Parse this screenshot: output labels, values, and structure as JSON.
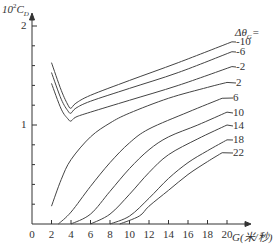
{
  "chart_data": {
    "type": "line",
    "title": "",
    "ylabel": "10²C_D",
    "xlabel": "G(米/秒)",
    "xlim": [
      0,
      20.5
    ],
    "ylim": [
      0,
      2
    ],
    "x_ticks": [
      "0",
      "2",
      "4",
      "6",
      "8",
      "10",
      "12",
      "14",
      "16",
      "18",
      "20"
    ],
    "y_ticks": [
      "1",
      "2"
    ],
    "grid": false,
    "legend_title": "Δθ_G=",
    "legend_position": "inline-right",
    "series": [
      {
        "name": "-10",
        "x": [
          2,
          3,
          3.7,
          4,
          4.5,
          6,
          10,
          15,
          20.5
        ],
        "values": [
          1.63,
          1.35,
          1.2,
          1.17,
          1.22,
          1.3,
          1.45,
          1.63,
          1.84
        ]
      },
      {
        "name": "-6",
        "x": [
          2,
          3,
          3.7,
          4,
          4.5,
          6,
          10,
          15,
          20.5
        ],
        "values": [
          1.53,
          1.26,
          1.14,
          1.12,
          1.17,
          1.24,
          1.37,
          1.53,
          1.74
        ]
      },
      {
        "name": "-2",
        "x": [
          2,
          3,
          3.7,
          4,
          4.5,
          6,
          10,
          15,
          20.5
        ],
        "values": [
          1.42,
          1.16,
          1.06,
          1.04,
          1.08,
          1.13,
          1.25,
          1.4,
          1.59
        ]
      },
      {
        "name": "2",
        "x": [
          2,
          3,
          4,
          6,
          8,
          10,
          14,
          18,
          20
        ],
        "values": [
          0.18,
          0.45,
          0.65,
          0.88,
          1.02,
          1.12,
          1.27,
          1.38,
          1.43
        ]
      },
      {
        "name": "6",
        "x": [
          2.7,
          4,
          6,
          8,
          10,
          12,
          16,
          19.5
        ],
        "values": [
          0,
          0.12,
          0.38,
          0.62,
          0.82,
          0.96,
          1.13,
          1.27
        ]
      },
      {
        "name": "10",
        "x": [
          4,
          6,
          8,
          10,
          12,
          14,
          17,
          20
        ],
        "values": [
          0,
          0.1,
          0.33,
          0.56,
          0.75,
          0.88,
          1.0,
          1.13
        ]
      },
      {
        "name": "14",
        "x": [
          6,
          8,
          10,
          12,
          14,
          17,
          20
        ],
        "values": [
          0,
          0.1,
          0.3,
          0.52,
          0.7,
          0.86,
          1.0
        ]
      },
      {
        "name": "18",
        "x": [
          8,
          10,
          12,
          14,
          16,
          18,
          20
        ],
        "values": [
          0,
          0.08,
          0.26,
          0.46,
          0.62,
          0.74,
          0.85
        ]
      },
      {
        "name": "22",
        "x": [
          9,
          11,
          12,
          14,
          16,
          18,
          19.5
        ],
        "values": [
          0,
          0.08,
          0.18,
          0.34,
          0.5,
          0.63,
          0.72
        ]
      }
    ]
  },
  "labels": {
    "ylabel_base": "10",
    "ylabel_exp": "2",
    "ylabel_var": "C",
    "ylabel_sub": "D",
    "xlabel": "G(米/秒)",
    "legend_title": "Δθ",
    "legend_title_sub": "G",
    "legend_title_eq": "="
  }
}
